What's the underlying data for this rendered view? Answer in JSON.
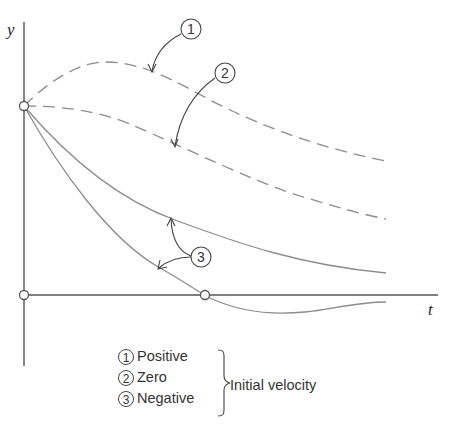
{
  "diagram": {
    "axes": {
      "y_label": "y",
      "x_label": "t"
    },
    "curves": [
      {
        "id": "1",
        "style": "dashed",
        "description": "Positive initial velocity: rises to a maximum then decays"
      },
      {
        "id": "2",
        "style": "dashed",
        "description": "Zero initial velocity: starts flat then decays"
      },
      {
        "id": "3a",
        "style": "solid",
        "description": "Negative initial velocity: decays without crossing"
      },
      {
        "id": "3b",
        "style": "solid",
        "description": "Negative initial velocity: crosses the t-axis once then approaches from below"
      }
    ],
    "callouts": [
      {
        "label": "1"
      },
      {
        "label": "2"
      },
      {
        "label": "3"
      }
    ],
    "legend": {
      "items": [
        {
          "number": "1",
          "label": "Positive"
        },
        {
          "number": "2",
          "label": "Zero"
        },
        {
          "number": "3",
          "label": "Negative"
        }
      ],
      "group_label": "Initial velocity"
    }
  }
}
